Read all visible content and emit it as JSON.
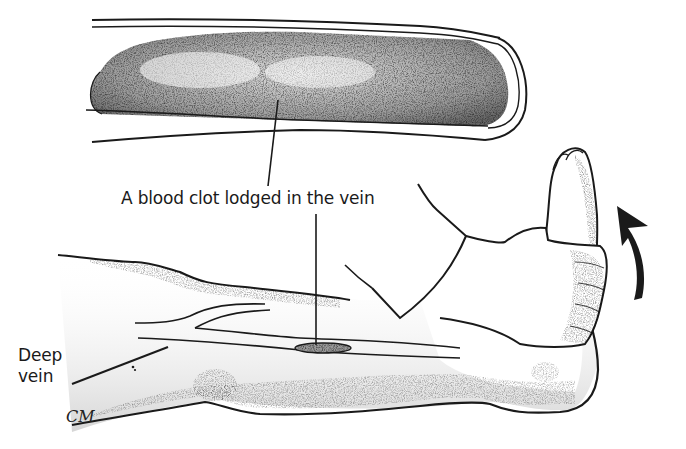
{
  "figure": {
    "labels": {
      "clot": "A blood clot lodged in the vein",
      "deep_vein_line1": "Deep",
      "deep_vein_line2": "vein"
    },
    "signature": "CM",
    "arrow_direction": "upward (foot flexed toward body)",
    "colors": {
      "ink": "#1a1a1a",
      "background": "#ffffff",
      "stipple": "#555555"
    }
  }
}
